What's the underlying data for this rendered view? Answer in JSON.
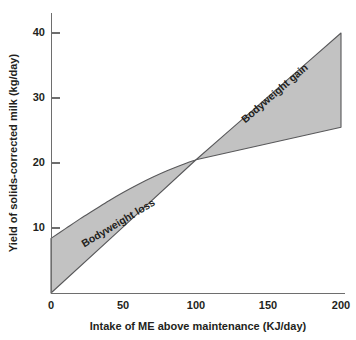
{
  "chart_data": {
    "type": "area",
    "title": "",
    "subtitle": "",
    "xlabel": "Intake of ME above maintenance (KJ/day)",
    "ylabel": "Yield of solids-corrected milk (kg/day)",
    "xlim": [
      0,
      200
    ],
    "ylim": [
      0,
      43
    ],
    "xticks": [
      0,
      50,
      100,
      150,
      200
    ],
    "xtick_labels": [
      "0",
      "50",
      "100",
      "150",
      "200"
    ],
    "yticks": [
      10,
      20,
      30,
      40
    ],
    "ytick_labels": [
      "10",
      "20",
      "30",
      "40"
    ],
    "grid": false,
    "legend": "none",
    "fill_color": "#c2c2c2",
    "line_color": "#58585a",
    "axis_color": "#6e6e6e",
    "text_color": "#231f20",
    "background": "#ffffff",
    "crossover": {
      "x": 100,
      "y": 20.5
    },
    "series": [
      {
        "name": "Upper boundary",
        "description": "Concave curve: high-yield / bodyweight-loss response",
        "x": [
          0,
          10,
          20,
          30,
          40,
          50,
          60,
          70,
          80,
          90,
          100,
          120,
          140,
          160,
          180,
          200
        ],
        "values": [
          8.4,
          9.9,
          11.4,
          12.8,
          14.2,
          15.5,
          16.7,
          17.8,
          18.8,
          19.7,
          20.5,
          24.4,
          28.3,
          32.2,
          36.1,
          40.0
        ]
      },
      {
        "name": "Lower boundary",
        "description": "Straight line through the origin: low-yield response",
        "x": [
          0,
          50,
          100,
          150,
          200
        ],
        "values": [
          0.0,
          10.2,
          20.5,
          23.0,
          25.5
        ]
      }
    ],
    "annotations": [
      {
        "text": "Bodyweight loss",
        "x": 47,
        "y": 12.2,
        "rotation": -31
      },
      {
        "text": "Bodyweight gain",
        "x": 155,
        "y": 30.5,
        "rotation": -41
      }
    ]
  },
  "figure": {
    "x_axis_title": "Intake of ME above maintenance (KJ/day)",
    "y_axis_title": "Yield of solids-corrected milk (kg/day)",
    "band_loss_label": "Bodyweight loss",
    "band_gain_label": "Bodyweight gain",
    "y_tick_40": "40",
    "y_tick_30": "30",
    "y_tick_20": "20",
    "y_tick_10": "10",
    "x_tick_0": "0",
    "x_tick_50": "50",
    "x_tick_100": "100",
    "x_tick_150": "150",
    "x_tick_200": "200"
  }
}
